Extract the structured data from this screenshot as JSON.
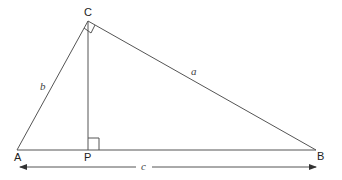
{
  "diagram": {
    "vertices": {
      "A": {
        "label": "A",
        "x": 17,
        "y": 150
      },
      "B": {
        "label": "B",
        "x": 316,
        "y": 150
      },
      "C": {
        "label": "C",
        "x": 88,
        "y": 21
      },
      "P": {
        "label": "P",
        "x": 88,
        "y": 150
      }
    },
    "sides": {
      "a": {
        "label": "a",
        "from": "C",
        "to": "B"
      },
      "b": {
        "label": "b",
        "from": "A",
        "to": "C"
      },
      "c": {
        "label": "c",
        "from": "A",
        "to": "B"
      }
    },
    "right_angles": [
      "C",
      "P"
    ],
    "altitude": {
      "from": "C",
      "to": "P"
    },
    "line_color": "#555555"
  }
}
